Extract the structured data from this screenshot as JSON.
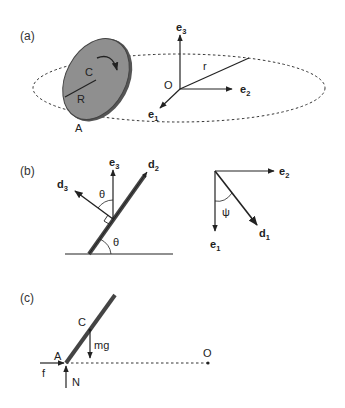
{
  "panels": {
    "a": {
      "label": "(a)",
      "disk_center": "C",
      "disk_radius": "R",
      "contact_point": "A",
      "origin": "O",
      "path_radius": "r",
      "axes": [
        {
          "base": "e",
          "sub": "3"
        },
        {
          "base": "e",
          "sub": "2"
        },
        {
          "base": "e",
          "sub": "1"
        }
      ]
    },
    "b": {
      "label": "(b)",
      "left": {
        "vectors": [
          {
            "base": "e",
            "sub": "3"
          },
          {
            "base": "d",
            "sub": "2"
          },
          {
            "base": "d",
            "sub": "3"
          }
        ],
        "angle_top": "θ",
        "angle_bottom": "θ"
      },
      "right": {
        "vectors": [
          {
            "base": "e",
            "sub": "2"
          },
          {
            "base": "e",
            "sub": "1"
          },
          {
            "base": "d",
            "sub": "1"
          }
        ],
        "angle": "ψ"
      }
    },
    "c": {
      "label": "(c)",
      "center": "C",
      "contact_point": "A",
      "gravity": "mg",
      "friction": "f",
      "normal": "N",
      "origin": "O"
    }
  },
  "colors": {
    "ink": "#222222",
    "disk_fill": "#8f8f8f",
    "disk_edge": "#555555"
  }
}
